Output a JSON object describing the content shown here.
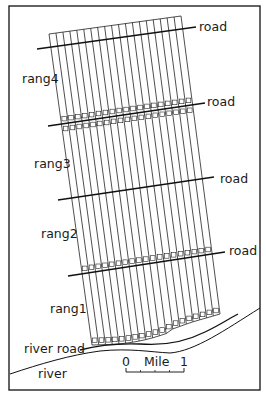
{
  "diagram": {
    "frame": {
      "x": 9,
      "y": 6,
      "w": 251,
      "h": 384
    },
    "strips": {
      "count": 19,
      "top_left": [
        49,
        34
      ],
      "top_right": [
        181,
        16
      ],
      "bottom_left": [
        92,
        345
      ],
      "bottom_right": [
        220,
        318
      ]
    },
    "ranges": [
      {
        "label": "rang4",
        "x": 22,
        "y": 83
      },
      {
        "label": "rang3",
        "x": 34,
        "y": 168
      },
      {
        "label": "rang2",
        "x": 41,
        "y": 238
      },
      {
        "label": "rang1",
        "x": 50,
        "y": 313
      }
    ],
    "roads": [
      {
        "label": "road",
        "x1": 37,
        "y1": 49,
        "x2": 196,
        "y2": 27,
        "lx": 199,
        "ly": 31
      },
      {
        "label": "road",
        "x1": 48,
        "y1": 126,
        "x2": 205,
        "y2": 103,
        "lx": 207,
        "ly": 106
      },
      {
        "label": "road",
        "x1": 58,
        "y1": 200,
        "x2": 214,
        "y2": 177,
        "lx": 220,
        "ly": 183
      },
      {
        "label": "road",
        "x1": 68,
        "y1": 276,
        "x2": 225,
        "y2": 252,
        "lx": 229,
        "ly": 255
      }
    ],
    "river_road": {
      "label": "river road",
      "lx": 24,
      "ly": 353
    },
    "river": {
      "label": "river",
      "lx": 38,
      "ly": 378
    },
    "scale_bar": {
      "zero": "0",
      "unit": "Mile",
      "one": "1",
      "x1": 126,
      "x2": 184,
      "y": 372
    }
  }
}
